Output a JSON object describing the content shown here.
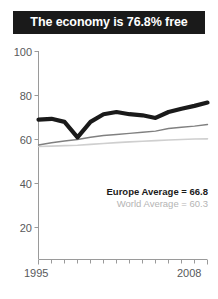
{
  "title": {
    "text": "The economy is 76.8% free"
  },
  "legend": {
    "europe_label": "Europe Average = 66.8",
    "world_label": "World Average = 60.3"
  },
  "colors": {
    "title_background": "#1a1a1a",
    "title_text": "#ffffff",
    "country_line": "#1a1a1a",
    "europe_line": "#808080",
    "world_line": "#cfcfcf",
    "axis": "#9a9a9a",
    "tick_text": "#58595b"
  },
  "chart_data": {
    "type": "line",
    "title": "The economy is 76.8% free",
    "xlabel": "",
    "ylabel": "",
    "xlim": [
      1995,
      2008
    ],
    "ylim": [
      0,
      100
    ],
    "yticks": [
      100,
      80,
      60,
      40,
      20
    ],
    "ytick_labels": [
      "100",
      "80",
      "60",
      "40",
      "20"
    ],
    "xticks": [
      1995,
      1996,
      1997,
      1998,
      1999,
      2000,
      2001,
      2002,
      2003,
      2004,
      2005,
      2006,
      2007,
      2008
    ],
    "xtick_labels_shown": [
      "1995",
      "2008"
    ],
    "grid": false,
    "legend_position": "inside-lower-right",
    "x": [
      1995,
      1996,
      1997,
      1998,
      1999,
      2000,
      2001,
      2002,
      2003,
      2004,
      2005,
      2006,
      2007,
      2008
    ],
    "series": [
      {
        "name": "Country",
        "style": "thick-black",
        "values": [
          69.0,
          69.4,
          68.0,
          61.0,
          68.0,
          71.5,
          72.5,
          71.5,
          71.0,
          69.8,
          72.5,
          74.0,
          75.3,
          76.8
        ]
      },
      {
        "name": "Europe Average",
        "style": "medium-gray",
        "average": 66.8,
        "values": [
          57.5,
          58.5,
          59.3,
          60.0,
          61.0,
          61.8,
          62.3,
          62.8,
          63.3,
          63.8,
          65.0,
          65.6,
          66.1,
          66.8
        ]
      },
      {
        "name": "World Average",
        "style": "light-gray",
        "average": 60.3,
        "values": [
          56.8,
          57.0,
          57.2,
          57.4,
          57.8,
          58.2,
          58.6,
          58.9,
          59.2,
          59.5,
          59.8,
          60.0,
          60.2,
          60.3
        ]
      }
    ]
  }
}
